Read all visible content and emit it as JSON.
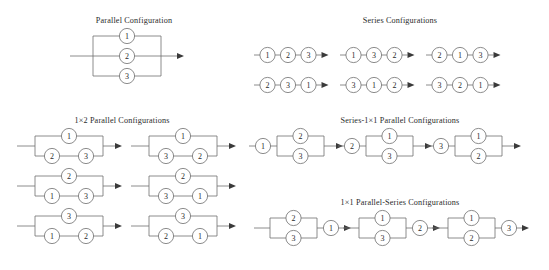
{
  "figure": {
    "background_color": "#ffffff",
    "stroke_color": "#6f6f6f",
    "text_color": "#2b2b2b",
    "arrow_color": "#3a3a3a"
  },
  "sections": [
    {
      "id": "parallel",
      "title": "Parallel  Configuration",
      "title_x": 134,
      "title_y": 16,
      "type": "parallel-3",
      "items": [
        {
          "x": 88,
          "y": 30,
          "branches": [
            "1",
            "2",
            "3"
          ]
        }
      ]
    },
    {
      "id": "series",
      "title": "Series  Configurations",
      "title_x": 400,
      "title_y": 16,
      "type": "series-3",
      "items": [
        {
          "x": 259,
          "y": 55,
          "chain": [
            "1",
            "2",
            "3"
          ]
        },
        {
          "x": 345,
          "y": 55,
          "chain": [
            "1",
            "3",
            "2"
          ]
        },
        {
          "x": 431,
          "y": 55,
          "chain": [
            "2",
            "1",
            "3"
          ]
        },
        {
          "x": 259,
          "y": 85,
          "chain": [
            "2",
            "3",
            "1"
          ]
        },
        {
          "x": 345,
          "y": 85,
          "chain": [
            "3",
            "1",
            "2"
          ]
        },
        {
          "x": 431,
          "y": 85,
          "chain": [
            "3",
            "2",
            "1"
          ]
        }
      ]
    },
    {
      "id": "parallel-1x2",
      "title": "1×2 Parallel  Configurations",
      "title_x": 122,
      "title_y": 116,
      "type": "parallel-1x2",
      "items": [
        {
          "x": 26,
          "y": 134,
          "top": "1",
          "bottom": [
            "2",
            "3"
          ]
        },
        {
          "x": 140,
          "y": 134,
          "top": "1",
          "bottom": [
            "3",
            "2"
          ]
        },
        {
          "x": 26,
          "y": 174,
          "top": "2",
          "bottom": [
            "1",
            "3"
          ]
        },
        {
          "x": 140,
          "y": 174,
          "top": "2",
          "bottom": [
            "3",
            "1"
          ]
        },
        {
          "x": 26,
          "y": 214,
          "top": "3",
          "bottom": [
            "1",
            "2"
          ]
        },
        {
          "x": 140,
          "y": 214,
          "top": "3",
          "bottom": [
            "2",
            "1"
          ]
        }
      ]
    },
    {
      "id": "series-1x1-parallel",
      "title": "Series-1×1 Parallel Configurations",
      "title_x": 400,
      "title_y": 116,
      "type": "series-parallel",
      "items": [
        {
          "x": 256,
          "y": 134,
          "lead": "1",
          "top": "2",
          "bottom": "3"
        },
        {
          "x": 345,
          "y": 134,
          "lead": "2",
          "top": "1",
          "bottom": "3"
        },
        {
          "x": 434,
          "y": 134,
          "lead": "3",
          "top": "1",
          "bottom": "2"
        }
      ]
    },
    {
      "id": "parallel-1x1-series",
      "title": "1×1 Parallel-Series  Configurations",
      "title_x": 400,
      "title_y": 198,
      "type": "parallel-series",
      "items": [
        {
          "x": 262,
          "y": 216,
          "top": "2",
          "bottom": "3",
          "tail": "1"
        },
        {
          "x": 351,
          "y": 216,
          "top": "1",
          "bottom": "3",
          "tail": "2"
        },
        {
          "x": 440,
          "y": 216,
          "top": "1",
          "bottom": "2",
          "tail": "3"
        }
      ]
    }
  ]
}
